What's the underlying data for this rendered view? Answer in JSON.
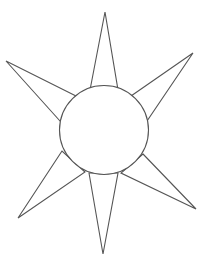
{
  "figure": {
    "background_color": "#ffffff",
    "stroke_color": "#555555",
    "fill_color": "#ffffff",
    "core": {
      "cx": 104,
      "cy": 130,
      "r": 44.5
    },
    "rays": [
      {
        "name": "top",
        "points": "90,90 105,12 118,90"
      },
      {
        "name": "upper-left",
        "points": "78,97 6,61 60,121"
      },
      {
        "name": "upper-right",
        "points": "131,96 193,53 147,121"
      },
      {
        "name": "lower-left",
        "points": "62,151 18,218 85,172"
      },
      {
        "name": "lower-right",
        "points": "143,154 196,209 121,173"
      },
      {
        "name": "bottom",
        "points": "89,173 103,254 118,173"
      }
    ]
  }
}
